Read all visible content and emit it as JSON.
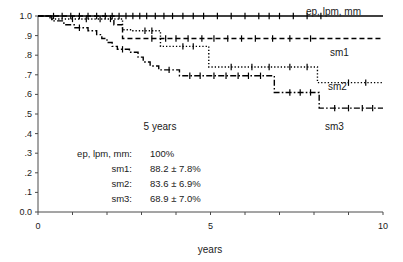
{
  "chart_data": {
    "type": "line",
    "title": "",
    "subtitle": "",
    "xlabel": "years",
    "ylabel": "",
    "xlim": [
      0,
      10
    ],
    "ylim": [
      0.0,
      1.0
    ],
    "grid": false,
    "legend_position": "right-inline",
    "x_ticks": [
      0,
      1,
      2,
      3,
      4,
      5,
      6,
      7,
      8,
      9,
      10
    ],
    "x_tick_labels": [
      "0",
      "",
      "",
      "",
      "",
      "5",
      "",
      "",
      "",
      "",
      "10"
    ],
    "y_ticks": [
      0.0,
      0.1,
      0.2,
      0.3,
      0.4,
      0.5,
      0.6,
      0.7,
      0.8,
      0.9,
      1.0
    ],
    "y_tick_labels": [
      "0.0",
      ".1",
      ".2",
      ".3",
      ".4",
      ".5",
      ".6",
      ".7",
      ".8",
      ".9",
      "1.0"
    ],
    "annotation": "5  years",
    "series": [
      {
        "name": "ep, lpm, mm",
        "label": "ep, lpm, mm",
        "style": "solid",
        "color": "#000000",
        "final_value": 1.0,
        "steps": [
          [
            0.0,
            1.0
          ],
          [
            10.0,
            1.0
          ]
        ],
        "censor_marks": [
          0.45,
          0.7,
          0.95,
          1.2,
          1.45,
          1.7,
          1.95,
          2.15,
          2.35,
          2.55,
          2.75,
          2.95,
          3.15,
          3.4,
          3.65,
          3.9,
          4.2,
          4.5,
          4.8,
          5.2,
          5.6,
          6.0,
          6.4,
          6.7,
          7.0,
          7.4,
          7.8,
          8.2
        ]
      },
      {
        "name": "sm1",
        "label": "sm1",
        "style": "dashed",
        "color": "#000000",
        "final_value": 0.89,
        "steps": [
          [
            0.0,
            1.0
          ],
          [
            2.2,
            1.0
          ],
          [
            2.2,
            0.955
          ],
          [
            2.45,
            0.955
          ],
          [
            2.45,
            0.885
          ],
          [
            10.0,
            0.885
          ]
        ],
        "censor_marks": [
          3.3,
          3.7,
          4.0,
          4.35,
          4.75,
          5.1,
          5.5,
          5.9,
          6.3,
          6.8,
          7.3,
          7.9
        ]
      },
      {
        "name": "sm2",
        "label": "sm2",
        "style": "dotted",
        "color": "#000000",
        "final_value": 0.66,
        "steps": [
          [
            0.0,
            1.0
          ],
          [
            0.35,
            1.0
          ],
          [
            0.35,
            0.985
          ],
          [
            2.45,
            0.985
          ],
          [
            2.45,
            0.93
          ],
          [
            2.75,
            0.93
          ],
          [
            2.75,
            0.925
          ],
          [
            3.55,
            0.925
          ],
          [
            3.55,
            0.845
          ],
          [
            4.95,
            0.845
          ],
          [
            4.95,
            0.74
          ],
          [
            8.1,
            0.74
          ],
          [
            8.1,
            0.66
          ],
          [
            10.0,
            0.66
          ]
        ],
        "censor_marks": [
          1.0,
          1.4,
          1.8,
          2.1,
          3.1,
          3.3,
          4.2,
          4.5,
          5.6,
          6.2,
          6.7,
          7.3,
          7.8,
          9.0,
          9.5
        ]
      },
      {
        "name": "sm3",
        "label": "sm3",
        "style": "dashdot",
        "color": "#000000",
        "final_value": 0.53,
        "steps": [
          [
            0.0,
            1.0
          ],
          [
            0.4,
            1.0
          ],
          [
            0.4,
            0.975
          ],
          [
            0.75,
            0.975
          ],
          [
            0.75,
            0.955
          ],
          [
            1.05,
            0.955
          ],
          [
            1.05,
            0.94
          ],
          [
            1.45,
            0.94
          ],
          [
            1.45,
            0.925
          ],
          [
            1.7,
            0.925
          ],
          [
            1.7,
            0.905
          ],
          [
            1.85,
            0.905
          ],
          [
            1.85,
            0.885
          ],
          [
            2.0,
            0.885
          ],
          [
            2.0,
            0.865
          ],
          [
            2.15,
            0.865
          ],
          [
            2.15,
            0.845
          ],
          [
            2.3,
            0.845
          ],
          [
            2.3,
            0.83
          ],
          [
            2.65,
            0.83
          ],
          [
            2.65,
            0.815
          ],
          [
            2.9,
            0.815
          ],
          [
            2.9,
            0.79
          ],
          [
            3.05,
            0.79
          ],
          [
            3.05,
            0.765
          ],
          [
            3.25,
            0.765
          ],
          [
            3.25,
            0.745
          ],
          [
            3.5,
            0.745
          ],
          [
            3.5,
            0.725
          ],
          [
            4.1,
            0.725
          ],
          [
            4.1,
            0.695
          ],
          [
            6.85,
            0.695
          ],
          [
            6.85,
            0.61
          ],
          [
            8.15,
            0.61
          ],
          [
            8.15,
            0.53
          ],
          [
            10.0,
            0.53
          ]
        ],
        "censor_marks": [
          1.2,
          2.45,
          3.8,
          4.4,
          4.7,
          5.1,
          5.45,
          5.8,
          6.1,
          6.45,
          7.3,
          7.6,
          7.9,
          8.6,
          9.0,
          9.4,
          9.7
        ]
      }
    ]
  },
  "legend_box": {
    "rows": [
      {
        "name": "ep, lpm, mm:",
        "value": "100%"
      },
      {
        "name": "sm1:",
        "value": "88.2 ± 7.8%"
      },
      {
        "name": "sm2:",
        "value": "83.6 ± 6.9%"
      },
      {
        "name": "sm3:",
        "value": "68.9 ± 7.0%"
      }
    ]
  },
  "colors": {
    "axis": "#4a4a4a",
    "curve": "#000000",
    "text": "#1a1a1a",
    "background": "#ffffff"
  }
}
